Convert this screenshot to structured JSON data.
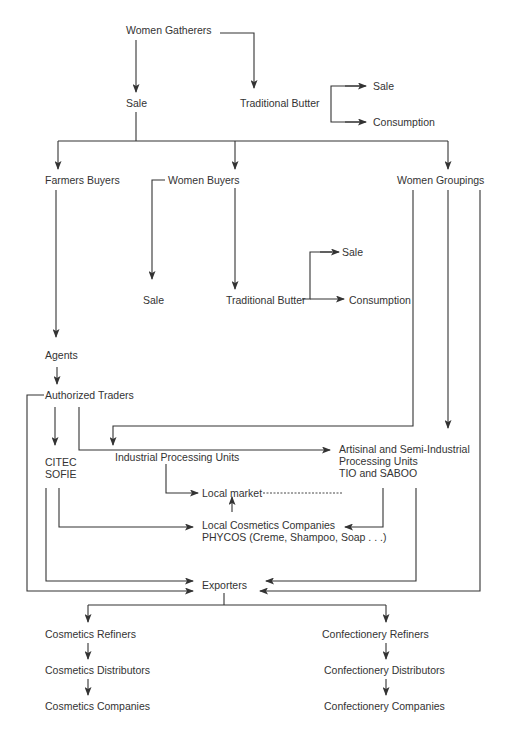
{
  "diagram": {
    "type": "flowchart",
    "colors": {
      "line": "#333333",
      "text": "#333333",
      "background": "#ffffff"
    },
    "nodes": {
      "women_gatherers": {
        "label": "Women Gatherers"
      },
      "sale_top": {
        "label": "Sale"
      },
      "traditional_butter_top": {
        "label": "Traditional Butter"
      },
      "sale_tb_top": {
        "label": "Sale"
      },
      "consumption_top": {
        "label": "Consumption"
      },
      "farmers_buyers": {
        "label": "Farmers Buyers"
      },
      "women_buyers": {
        "label": "Women Buyers"
      },
      "women_groupings": {
        "label": "Women Groupings"
      },
      "sale_wb": {
        "label": "Sale"
      },
      "traditional_butter_wb": {
        "label": "Traditional Butter"
      },
      "sale_tb_wb": {
        "label": "Sale"
      },
      "consumption_wb": {
        "label": "Consumption"
      },
      "agents": {
        "label": "Agents"
      },
      "authorized_traders": {
        "label": "Authorized Traders"
      },
      "citec_sofie": {
        "lines": [
          "CITEC",
          "SOFIE"
        ]
      },
      "industrial_processing_units": {
        "label": "Industrial Processing Units"
      },
      "artisinal_units": {
        "lines": [
          "Artisinal and Semi-Industrial",
          "Processing Units",
          "TIO and SABOO"
        ]
      },
      "local_market": {
        "label": "Local market"
      },
      "local_cosmetics": {
        "lines": [
          "Local Cosmetics Companies",
          "PHYCOS (Creme, Shampoo, Soap . . .)"
        ]
      },
      "exporters": {
        "label": "Exporters"
      },
      "cosmetics_refiners": {
        "label": "Cosmetics Refiners"
      },
      "cosmetics_distributors": {
        "label": "Cosmetics Distributors"
      },
      "cosmetics_companies": {
        "label": "Cosmetics Companies"
      },
      "confectionery_refiners": {
        "label": "Confectionery Refiners"
      },
      "confectionery_distributors": {
        "label": "Confectionery Distributors"
      },
      "confectionery_companies": {
        "label": "Confectionery Companies"
      }
    },
    "edges": [
      [
        "Women Gatherers",
        "Sale"
      ],
      [
        "Women Gatherers",
        "Traditional Butter"
      ],
      [
        "Traditional Butter",
        "Sale"
      ],
      [
        "Traditional Butter",
        "Consumption"
      ],
      [
        "Sale",
        "Farmers Buyers"
      ],
      [
        "Sale",
        "Women Buyers"
      ],
      [
        "Sale",
        "Women Groupings"
      ],
      [
        "Women Buyers",
        "Sale"
      ],
      [
        "Women Buyers",
        "Traditional Butter"
      ],
      [
        "Traditional Butter",
        "Sale"
      ],
      [
        "Traditional Butter",
        "Consumption"
      ],
      [
        "Farmers Buyers",
        "Agents"
      ],
      [
        "Agents",
        "Authorized Traders"
      ],
      [
        "Authorized Traders",
        "CITEC SOFIE"
      ],
      [
        "Authorized Traders",
        "Artisinal and Semi-Industrial Processing Units"
      ],
      [
        "Authorized Traders",
        "Exporters"
      ],
      [
        "Women Groupings",
        "Industrial Processing Units"
      ],
      [
        "Women Groupings",
        "Artisinal and Semi-Industrial Processing Units"
      ],
      [
        "Women Groupings",
        "Exporters"
      ],
      [
        "Industrial Processing Units",
        "Local market"
      ],
      [
        "Local Cosmetics Companies",
        "Local market"
      ],
      [
        "Artisinal and Semi-Industrial Processing Units",
        "Local market (dashed)"
      ],
      [
        "Artisinal and Semi-Industrial Processing Units",
        "Local Cosmetics Companies"
      ],
      [
        "Artisinal and Semi-Industrial Processing Units",
        "Exporters"
      ],
      [
        "CITEC SOFIE",
        "Local Cosmetics Companies"
      ],
      [
        "CITEC SOFIE",
        "Exporters"
      ],
      [
        "Exporters",
        "Cosmetics Refiners"
      ],
      [
        "Exporters",
        "Confectionery Refiners"
      ],
      [
        "Cosmetics Refiners",
        "Cosmetics Distributors"
      ],
      [
        "Cosmetics Distributors",
        "Cosmetics Companies"
      ],
      [
        "Confectionery Refiners",
        "Confectionery Distributors"
      ],
      [
        "Confectionery Distributors",
        "Confectionery Companies"
      ]
    ]
  }
}
